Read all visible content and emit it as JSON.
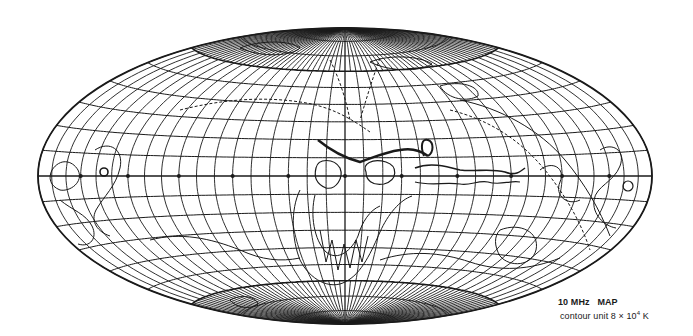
{
  "figure": {
    "title": "10 MHz   MAP",
    "contour_unit_label": "contour unit",
    "contour_unit_value": "8 × 10",
    "contour_unit_exponent": "4",
    "contour_unit_suffix": " K",
    "projection": "Hammer-Aitoff (equal-area)",
    "colors": {
      "ink": "#1a1a1a",
      "background": "#ffffff"
    }
  },
  "map_geometry": {
    "center_x": 345,
    "center_y": 176,
    "radius_x": 307,
    "radius_y": 148,
    "parallel_step_deg": 10,
    "meridian_step_deg": 10,
    "polar_meridian_step_deg": 5,
    "polar_cap_lat_deg": 60,
    "equator_marker_step_deg": 30
  },
  "contours": [
    {
      "id": "ridge-north-of-center",
      "width": 2.4,
      "dashed": false,
      "d": "M318 140 C330 150 345 158 360 162 C372 158 385 152 400 150 C410 148 420 150 428 156"
    },
    {
      "id": "ridge-loop",
      "width": 2.0,
      "dashed": false,
      "d": "M424 156 C420 146 422 138 428 140 C434 142 434 152 428 156"
    },
    {
      "id": "center-blob-a",
      "width": 1.2,
      "dashed": false,
      "d": "M366 172 C362 164 372 158 386 162 C398 166 398 180 384 184 C372 186 366 180 366 172 Z"
    },
    {
      "id": "center-blob-b",
      "width": 1.2,
      "dashed": false,
      "d": "M316 168 C318 158 334 158 340 168 C344 178 336 190 326 188 C316 184 314 176 316 168 Z"
    },
    {
      "id": "center-band-1",
      "width": 1.6,
      "dashed": false,
      "d": "M415 168 C430 162 445 166 460 170 C475 172 490 168 505 172 C515 176 520 172 525 168"
    },
    {
      "id": "center-band-2",
      "width": 1.2,
      "dashed": false,
      "d": "M415 182 C430 186 445 182 460 184 C470 186 478 180 488 182 C500 186 510 180 520 182"
    },
    {
      "id": "galactic-loop-outer",
      "width": 1.0,
      "dashed": false,
      "d": "M300 190 C290 210 292 240 300 260 C310 280 330 290 345 282 C362 274 372 250 380 232 C388 214 400 200 412 196"
    },
    {
      "id": "galactic-loop-inner",
      "width": 1.0,
      "dashed": false,
      "d": "M315 195 C310 215 314 240 326 252 C338 262 352 250 358 236 C362 222 370 210 380 206"
    },
    {
      "id": "south-fingers",
      "width": 1.0,
      "dashed": false,
      "d": "M320 230 L326 262 L332 240 L338 270 L344 244 L350 268 L356 240 L362 262 L368 236"
    },
    {
      "id": "left-wiggle-1",
      "width": 1.0,
      "dashed": false,
      "d": "M52 170 C60 158 72 160 78 170 C84 182 70 192 60 190 C50 186 48 178 52 170"
    },
    {
      "id": "left-wiggle-2",
      "width": 1.0,
      "dashed": false,
      "d": "M95 150 C110 140 124 150 120 168 C116 186 104 196 96 210 C90 222 98 232 110 236"
    },
    {
      "id": "left-wiggle-3",
      "width": 1.0,
      "dashed": false,
      "d": "M60 200 C72 210 86 214 92 226 C98 238 90 248 78 244"
    },
    {
      "id": "left-spot",
      "width": 1.6,
      "dashed": false,
      "d": "M104 172 m-4 0 a4 4 0 1 0 8 0 a4 4 0 1 0 -8 0"
    },
    {
      "id": "right-wiggle-1",
      "width": 1.0,
      "dashed": false,
      "d": "M600 150 C612 142 626 150 620 166 C614 182 596 186 594 200 C592 214 604 226 616 228"
    },
    {
      "id": "right-wiggle-2",
      "width": 1.0,
      "dashed": false,
      "d": "M540 170 C552 160 566 168 560 182 C554 196 568 206 580 200"
    },
    {
      "id": "right-spot",
      "width": 1.2,
      "dashed": false,
      "d": "M628 186 m-5 0 a5 5 0 1 0 10 0 a5 5 0 1 0 -10 0"
    },
    {
      "id": "right-arc-dashed",
      "width": 1.0,
      "dashed": true,
      "d": "M450 110 C490 120 520 140 545 170 C565 195 580 220 590 250"
    },
    {
      "id": "right-arc",
      "width": 1.0,
      "dashed": false,
      "d": "M460 100 C500 108 540 130 565 160 C585 184 600 210 610 236"
    },
    {
      "id": "upper-dashed-1",
      "width": 1.0,
      "dashed": true,
      "d": "M180 110 C220 100 260 96 300 102 C330 106 350 118 370 132"
    },
    {
      "id": "upper-dashed-2",
      "width": 1.0,
      "dashed": true,
      "d": "M330 60 C340 80 346 100 350 120"
    },
    {
      "id": "upper-dashed-3",
      "width": 1.0,
      "dashed": true,
      "d": "M380 58 C372 80 366 100 360 120"
    },
    {
      "id": "upper-left-loop",
      "width": 1.0,
      "dashed": false,
      "d": "M240 48 C260 40 290 40 300 48 C292 56 262 58 240 48 Z"
    },
    {
      "id": "upper-right-loop",
      "width": 1.0,
      "dashed": false,
      "d": "M370 62 C390 54 420 56 432 64 C420 72 390 72 370 62 Z"
    },
    {
      "id": "lower-right-blob",
      "width": 1.0,
      "dashed": false,
      "d": "M500 230 C520 222 540 232 536 250 C532 266 510 268 500 256 C494 246 494 236 500 230 Z"
    },
    {
      "id": "lower-left-band",
      "width": 1.0,
      "dashed": false,
      "d": "M150 240 C180 232 210 238 240 250 C262 260 280 262 300 258"
    },
    {
      "id": "lower-band",
      "width": 1.0,
      "dashed": false,
      "d": "M380 260 C410 250 440 252 470 262 C500 272 530 270 560 258"
    },
    {
      "id": "bottom-loop",
      "width": 1.0,
      "dashed": false,
      "d": "M230 300 C240 294 256 296 258 304 C250 310 236 308 230 300 Z"
    },
    {
      "id": "top-right-loop",
      "width": 1.0,
      "dashed": false,
      "d": "M440 86 C460 80 480 86 478 96 C468 102 448 100 440 86 Z"
    }
  ]
}
